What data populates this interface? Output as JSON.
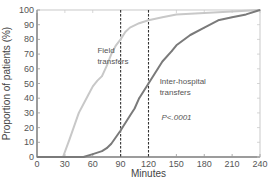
{
  "chart_data": {
    "type": "line",
    "title": "",
    "xlabel": "Minutes",
    "ylabel": "Proportion of patients (%)",
    "xlim": [
      0,
      240
    ],
    "ylim": [
      0,
      100
    ],
    "xticks": [
      0,
      30,
      60,
      90,
      120,
      150,
      180,
      210,
      240
    ],
    "yticks": [
      0,
      10,
      20,
      30,
      40,
      50,
      60,
      70,
      80,
      90,
      100
    ],
    "grid": false,
    "legend": "none",
    "reference_lines_x": [
      90,
      120
    ],
    "series": [
      {
        "name": "Field transfers",
        "color": "#c8c8c8",
        "x": [
          0,
          28,
          35,
          45,
          55,
          60,
          65,
          70,
          75,
          80,
          85,
          90,
          95,
          100,
          110,
          120,
          135,
          150,
          180,
          210,
          240
        ],
        "y": [
          0,
          0,
          12,
          30,
          42,
          48,
          52,
          55,
          62,
          70,
          76,
          80,
          85,
          88,
          91,
          93,
          95,
          97,
          98,
          99,
          100
        ]
      },
      {
        "name": "Inter-hospital transfers",
        "color": "#7a7a7a",
        "x": [
          0,
          50,
          60,
          70,
          75,
          80,
          90,
          100,
          105,
          110,
          120,
          130,
          135,
          145,
          150,
          165,
          180,
          195,
          210,
          225,
          240
        ],
        "y": [
          0,
          0,
          2,
          4,
          6,
          9,
          18,
          28,
          33,
          40,
          50,
          60,
          65,
          72,
          76,
          83,
          88,
          93,
          95,
          97,
          100
        ]
      }
    ],
    "annotations": [
      {
        "text": "Field",
        "at_x": 65,
        "at_y": 71
      },
      {
        "text": "transfers",
        "at_x": 65,
        "at_y": 63
      },
      {
        "text": "Inter-hospital",
        "at_x": 132,
        "at_y": 50
      },
      {
        "text": "transfers",
        "at_x": 132,
        "at_y": 42
      },
      {
        "text": "P<.0001",
        "at_x": 134,
        "at_y": 25
      }
    ]
  }
}
